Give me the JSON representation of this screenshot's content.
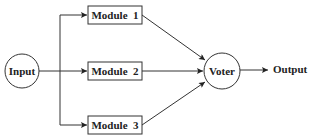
{
  "diagram": {
    "title": "",
    "colors": {
      "stroke": "#333333",
      "text": "#222222",
      "background": "#ffffff"
    },
    "nodes": {
      "input": {
        "label": "Input",
        "shape": "circle"
      },
      "module1": {
        "label": "Module  1",
        "shape": "rect"
      },
      "module2": {
        "label": "Module  2",
        "shape": "rect"
      },
      "module3": {
        "label": "Module  3",
        "shape": "rect"
      },
      "voter": {
        "label": "Voter",
        "shape": "circle"
      },
      "output": {
        "label": "Output",
        "shape": "text"
      }
    },
    "edges": [
      {
        "from": "input",
        "to": "module1"
      },
      {
        "from": "input",
        "to": "module2"
      },
      {
        "from": "input",
        "to": "module3"
      },
      {
        "from": "module1",
        "to": "voter"
      },
      {
        "from": "module2",
        "to": "voter"
      },
      {
        "from": "module3",
        "to": "voter"
      },
      {
        "from": "voter",
        "to": "output"
      }
    ]
  }
}
